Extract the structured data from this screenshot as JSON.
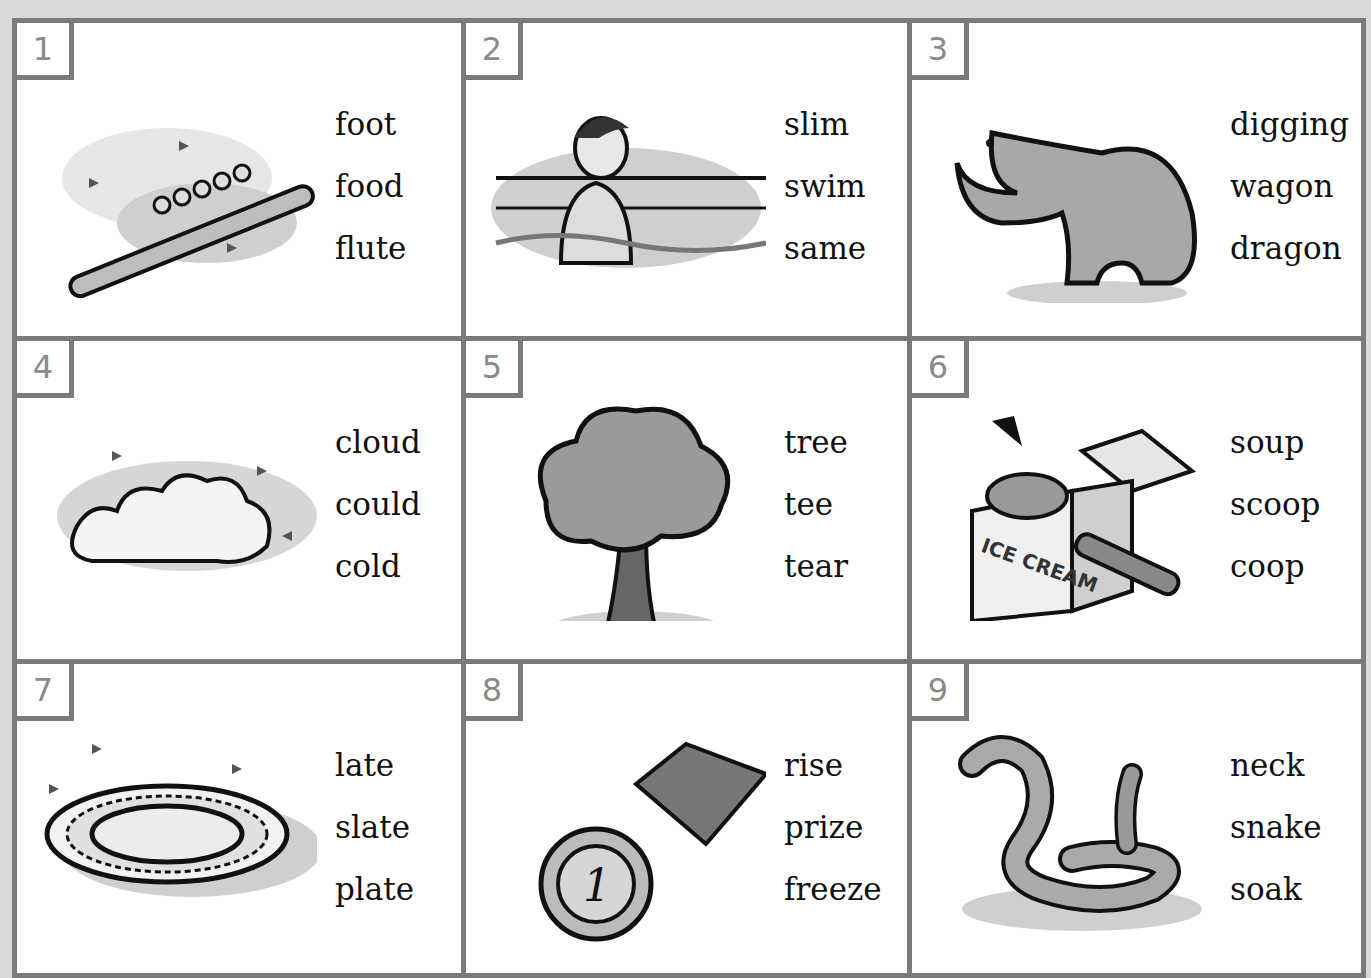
{
  "cards": [
    {
      "number": "1",
      "picture": "flute-icon",
      "words": [
        "foot",
        "food",
        "flute"
      ]
    },
    {
      "number": "2",
      "picture": "swimmer-icon",
      "words": [
        "slim",
        "swim",
        "same"
      ]
    },
    {
      "number": "3",
      "picture": "dragon-icon",
      "words": [
        "digging",
        "wagon",
        "dragon"
      ]
    },
    {
      "number": "4",
      "picture": "cloud-icon",
      "words": [
        "cloud",
        "could",
        "cold"
      ]
    },
    {
      "number": "5",
      "picture": "tree-icon",
      "words": [
        "tree",
        "tee",
        "tear"
      ]
    },
    {
      "number": "6",
      "picture": "ice-cream-scoop-icon",
      "words": [
        "soup",
        "scoop",
        "coop"
      ],
      "label": "ICE CREAM"
    },
    {
      "number": "7",
      "picture": "plate-icon",
      "words": [
        "late",
        "slate",
        "plate"
      ]
    },
    {
      "number": "8",
      "picture": "prize-medal-icon",
      "words": [
        "rise",
        "prize",
        "freeze"
      ],
      "medal_text": "1"
    },
    {
      "number": "9",
      "picture": "snake-icon",
      "words": [
        "neck",
        "snake",
        "soak"
      ]
    }
  ]
}
